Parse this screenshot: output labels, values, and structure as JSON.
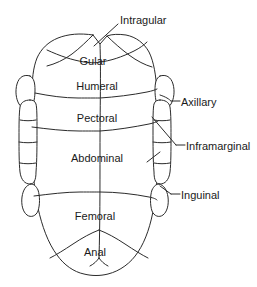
{
  "diagram": {
    "view": "ventral",
    "background_color": "#ffffff",
    "stroke_color": "#2b2b2b",
    "text_color": "#1a1a1a",
    "scute_labels": [
      {
        "id": "intragular",
        "text": "Intragular",
        "x": 120,
        "y": 14,
        "placement": "callout-top"
      },
      {
        "id": "gular",
        "text": "Gular",
        "x": 93,
        "y": 55,
        "placement": "inside"
      },
      {
        "id": "humeral",
        "text": "Humeral",
        "x": 97,
        "y": 80,
        "placement": "inside"
      },
      {
        "id": "pectoral",
        "text": "Pectoral",
        "x": 97,
        "y": 112,
        "placement": "inside"
      },
      {
        "id": "abdominal",
        "text": "Abdominal",
        "x": 97,
        "y": 152,
        "placement": "inside"
      },
      {
        "id": "femoral",
        "text": "Femoral",
        "x": 95,
        "y": 210,
        "placement": "inside"
      },
      {
        "id": "anal",
        "text": "Anal",
        "x": 95,
        "y": 246,
        "placement": "inside"
      }
    ],
    "callouts": [
      {
        "id": "axillary",
        "text": "Axillary",
        "x": 181,
        "y": 96,
        "leader": "M 171 101 L 180 101"
      },
      {
        "id": "inframarginal",
        "text": "Inframarginal",
        "x": 186,
        "y": 140,
        "leader": "M 176 145 L 185 145"
      },
      {
        "id": "inguinal",
        "text": "Inguinal",
        "x": 181,
        "y": 189,
        "leader": "M 171 194 L 180 194"
      }
    ],
    "leaders": [
      {
        "id": "intragular-leader",
        "path": "M 118 24 L 94 46"
      },
      {
        "id": "axillary-hook",
        "path": "M 160 95 C 166 97 169 99 171 101"
      },
      {
        "id": "inframarginal-leader",
        "path": "M 152 117 L 176 145"
      },
      {
        "id": "inframarginal-tick",
        "path": "M 147 162 L 160 152"
      },
      {
        "id": "inguinal-leader",
        "path": "M 160 186 L 171 194"
      }
    ],
    "outline": {
      "id": "plastron-outline",
      "path": "M 93 35 C 80 33 68 34 58 38 C 48 42 41 49 37 58 C 33 68 32 80 32 94 C 32 110 31 130 32 150 C 33 170 34 190 38 208 C 42 226 48 243 57 255 C 64 265 74 272 84 274 C 92 276 100 276 108 274 C 120 271 131 263 138 252 C 146 240 151 224 154 206 C 157 188 158 168 158 148 C 158 128 158 108 157 92 C 156 76 154 62 149 52 C 144 43 136 37 126 35 C 119 34 112 34 107 36 L 100 44 L 93 35 Z"
    },
    "seams": [
      {
        "id": "midline-seam",
        "path": "M 100 44 C 101 70 100 110 100 150 C 100 190 100 225 99 258"
      },
      {
        "id": "gular-humeral-seam",
        "path": "M 47 50 C 60 56 72 60 84 62 C 92 63 97 63 100 62 C 110 61 122 57 134 51 C 140 48 144 45 147 42"
      },
      {
        "id": "gular-left-seam",
        "path": "M 93 35 C 87 41 80 48 72 54 C 64 60 55 64 47 66"
      },
      {
        "id": "gular-right-seam",
        "path": "M 107 36 C 113 42 121 49 129 55 C 137 61 145 65 152 67"
      },
      {
        "id": "humeral-pectoral-seam",
        "path": "M 35 93 C 50 96 64 98 78 98 C 88 98 94 98 100 98 C 115 97 132 95 147 92 C 152 91 155 90 157 89"
      },
      {
        "id": "pectoral-abdominal-seam",
        "path": "M 32 127 C 48 129 64 131 79 131 C 89 131 95 131 100 131 C 116 130 134 127 149 124 C 154 123 156 122 158 121"
      },
      {
        "id": "abdominal-femoral-seam",
        "path": "M 34 196 C 50 194 66 192 80 192 C 90 192 95 192 100 192 C 116 192 134 194 149 197 C 154 198 156 199 157 200"
      },
      {
        "id": "femoral-anal-left-seam",
        "path": "M 99 230 C 91 233 82 238 73 244 C 64 250 56 255 50 258"
      },
      {
        "id": "femoral-anal-right-seam",
        "path": "M 99 230 C 107 233 116 238 125 244 C 134 250 142 255 148 258"
      },
      {
        "id": "anal-notch-seam",
        "path": "M 99 258 C 97 261 94 264 90 266 M 99 258 C 101 261 104 264 108 266"
      }
    ],
    "left_side": {
      "id": "left-marginal-group",
      "axillary_lobe": "M 30 76 C 24 74 19 77 17 84 C 15 91 16 99 19 104 C 22 109 27 110 31 107 C 34 104 35 97 35 90 C 35 83 34 78 30 76 Z",
      "inframarginal_column": "M 30 100 C 25 100 21 102 20 107 C 19 114 19 125 19 137 C 19 150 19 163 20 172 C 21 180 25 184 30 184 C 34 184 36 180 36 172 C 37 160 37 145 37 130 C 37 118 37 108 36 104 C 35 101 33 100 30 100 Z",
      "inframarginal_seams": [
        "M 20 120 C 25 121 31 121 36 120",
        "M 19 142 C 25 143 31 143 37 142",
        "M 20 163 C 25 164 31 164 36 163"
      ],
      "inguinal_lobe": "M 31 184 C 26 185 23 190 22 197 C 21 205 23 212 27 215 C 31 218 36 216 38 211 C 40 205 40 196 38 190 C 36 186 34 184 31 184 Z"
    },
    "right_side": {
      "id": "right-marginal-group",
      "axillary_lobe": "M 160 76 C 166 74 171 77 173 84 C 175 91 174 99 171 104 C 168 109 163 110 159 107 C 156 104 155 97 155 90 C 155 83 156 78 160 76 Z",
      "inframarginal_column": "M 160 100 C 165 100 169 102 170 107 C 171 114 171 125 171 137 C 171 150 171 163 170 172 C 169 180 165 184 160 184 C 156 184 154 180 154 172 C 153 160 153 145 153 130 C 153 118 153 108 154 104 C 155 101 157 100 160 100 Z",
      "inframarginal_seams": [
        "M 170 120 C 165 121 159 121 154 120",
        "M 171 142 C 165 143 159 143 153 142",
        "M 170 163 C 165 164 159 164 154 163"
      ],
      "inguinal_lobe": "M 159 184 C 164 185 167 190 168 197 C 169 205 167 212 163 215 C 159 218 154 216 152 211 C 150 205 150 196 152 190 C 154 186 156 184 159 184 Z"
    }
  }
}
